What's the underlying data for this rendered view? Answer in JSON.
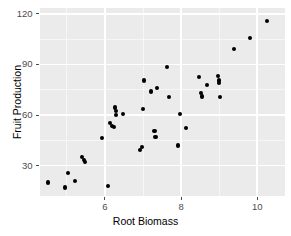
{
  "chart_data": {
    "type": "scatter",
    "title": "",
    "xlabel": "Root Biomass",
    "ylabel": "Fruit Production",
    "xlim": [
      4.28,
      10.73
    ],
    "ylim": [
      12.0,
      123.5
    ],
    "xticks": [
      6,
      8,
      10
    ],
    "xtick_labels": [
      "6",
      "8",
      "10"
    ],
    "yticks": [
      30,
      60,
      90,
      120
    ],
    "ytick_labels": [
      "30",
      "60",
      "90",
      "120"
    ],
    "x_minor_ticks": [
      5,
      7,
      9
    ],
    "y_minor_ticks": [
      45,
      75,
      105
    ],
    "grid": true,
    "legend": null,
    "point_color": "#000000",
    "panel_color": "#ebebeb",
    "grid_color": "#ffffff",
    "axis_text_color": "#4d4d4d",
    "points": [
      [
        4.5,
        20.0
      ],
      [
        4.95,
        17.0
      ],
      [
        5.02,
        25.5
      ],
      [
        5.22,
        21.0
      ],
      [
        5.4,
        35.0
      ],
      [
        5.44,
        33.5
      ],
      [
        5.48,
        32.0
      ],
      [
        5.92,
        46.5
      ],
      [
        6.09,
        18.0
      ],
      [
        6.14,
        55.5
      ],
      [
        6.18,
        53.5
      ],
      [
        6.23,
        53.0
      ],
      [
        6.26,
        64.5
      ],
      [
        6.28,
        62.5
      ],
      [
        6.29,
        60.0
      ],
      [
        6.47,
        60.5
      ],
      [
        6.92,
        39.5
      ],
      [
        6.97,
        41.0
      ],
      [
        6.99,
        63.5
      ],
      [
        7.03,
        80.5
      ],
      [
        7.22,
        74.0
      ],
      [
        7.3,
        50.5
      ],
      [
        7.33,
        47.0
      ],
      [
        7.36,
        76.0
      ],
      [
        7.62,
        88.5
      ],
      [
        7.68,
        70.5
      ],
      [
        7.91,
        42.0
      ],
      [
        7.97,
        60.5
      ],
      [
        8.13,
        52.5
      ],
      [
        8.48,
        82.5
      ],
      [
        8.52,
        73.0
      ],
      [
        8.54,
        71.0
      ],
      [
        8.68,
        78.0
      ],
      [
        8.96,
        83.0
      ],
      [
        8.99,
        80.5
      ],
      [
        9.0,
        79.0
      ],
      [
        9.02,
        70.5
      ],
      [
        9.38,
        99.0
      ],
      [
        9.82,
        105.5
      ],
      [
        10.25,
        116.0
      ]
    ]
  },
  "layout": {
    "panel": {
      "left": 39.5,
      "top": 8.0,
      "width": 245.5,
      "height": 188.0
    },
    "point_size": 4.2
  }
}
